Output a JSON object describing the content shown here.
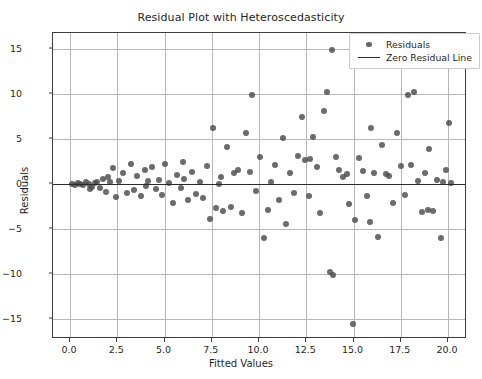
{
  "chart_data": {
    "type": "scatter",
    "title": "Residual Plot with Heteroscedasticity",
    "xlabel": "Fitted Values",
    "ylabel": "Residuals",
    "xlim": [
      -0.9,
      21.0
    ],
    "ylim": [
      -17.2,
      16.8
    ],
    "grid": true,
    "legend_position": "upper right",
    "xticks": [
      "0.0",
      "2.5",
      "5.0",
      "7.5",
      "10.0",
      "12.5",
      "15.0",
      "17.5",
      "20.0"
    ],
    "xtick_values": [
      0.0,
      2.5,
      5.0,
      7.5,
      10.0,
      12.5,
      15.0,
      17.5,
      20.0
    ],
    "yticks": [
      "15",
      "10",
      "5",
      "0",
      "−5",
      "−10",
      "−15"
    ],
    "ytick_values": [
      15,
      10,
      5,
      0,
      -5,
      -10,
      -15
    ],
    "series": [
      {
        "name": "Residuals",
        "marker": "circle",
        "color": "#4a4a4a",
        "points": [
          [
            0.1,
            0.05
          ],
          [
            0.25,
            -0.1
          ],
          [
            0.4,
            0.15
          ],
          [
            0.55,
            0.05
          ],
          [
            0.7,
            -0.05
          ],
          [
            0.85,
            0.2
          ],
          [
            1.0,
            0.0
          ],
          [
            1.15,
            -0.3
          ],
          [
            1.3,
            0.1
          ],
          [
            1.45,
            0.25
          ],
          [
            1.6,
            -0.4
          ],
          [
            1.75,
            0.6
          ],
          [
            1.9,
            -0.9
          ],
          [
            2.1,
            0.3
          ],
          [
            2.3,
            1.8
          ],
          [
            2.45,
            -1.4
          ],
          [
            2.6,
            0.4
          ],
          [
            2.8,
            1.3
          ],
          [
            3.0,
            -1.0
          ],
          [
            3.2,
            2.2
          ],
          [
            3.4,
            -0.6
          ],
          [
            3.55,
            0.9
          ],
          [
            3.75,
            -1.3
          ],
          [
            3.95,
            1.6
          ],
          [
            4.15,
            0.35
          ],
          [
            4.35,
            1.9
          ],
          [
            4.55,
            -0.5
          ],
          [
            4.7,
            0.45
          ],
          [
            4.85,
            -1.2
          ],
          [
            5.05,
            2.3
          ],
          [
            5.25,
            0.1
          ],
          [
            5.45,
            -2.1
          ],
          [
            5.65,
            1.05
          ],
          [
            5.85,
            -0.45
          ],
          [
            6.05,
            0.55
          ],
          [
            6.25,
            -1.7
          ],
          [
            6.45,
            1.4
          ],
          [
            6.65,
            -1.05
          ],
          [
            6.85,
            0.2
          ],
          [
            7.05,
            -1.55
          ],
          [
            7.25,
            2.05
          ],
          [
            7.4,
            -3.9
          ],
          [
            7.55,
            6.2
          ],
          [
            7.7,
            -2.6
          ],
          [
            7.9,
            0.05
          ],
          [
            8.1,
            -2.95
          ],
          [
            8.3,
            4.1
          ],
          [
            8.5,
            -2.55
          ],
          [
            8.7,
            1.25
          ],
          [
            8.9,
            1.55
          ],
          [
            9.1,
            -3.25
          ],
          [
            9.3,
            5.7
          ],
          [
            9.5,
            1.35
          ],
          [
            9.65,
            9.9
          ],
          [
            9.85,
            -0.75
          ],
          [
            10.05,
            3.05
          ],
          [
            10.25,
            -5.95
          ],
          [
            10.45,
            -2.9
          ],
          [
            10.65,
            0.25
          ],
          [
            10.85,
            2.15
          ],
          [
            11.05,
            -1.7
          ],
          [
            11.25,
            5.15
          ],
          [
            11.45,
            -4.45
          ],
          [
            11.65,
            1.2
          ],
          [
            11.85,
            -0.95
          ],
          [
            12.05,
            3.1
          ],
          [
            12.25,
            7.5
          ],
          [
            12.45,
            2.7
          ],
          [
            12.65,
            -1.35
          ],
          [
            12.85,
            5.2
          ],
          [
            13.05,
            1.95
          ],
          [
            13.25,
            -3.2
          ],
          [
            13.45,
            8.1
          ],
          [
            13.6,
            10.2
          ],
          [
            13.75,
            -9.7
          ],
          [
            13.85,
            14.95
          ],
          [
            13.9,
            -10.05
          ],
          [
            14.05,
            3.05
          ],
          [
            14.25,
            1.55
          ],
          [
            14.45,
            0.8
          ],
          [
            14.65,
            1.1
          ],
          [
            14.75,
            -2.15
          ],
          [
            14.95,
            -15.5
          ],
          [
            15.1,
            -3.95
          ],
          [
            15.3,
            2.9
          ],
          [
            15.5,
            1.45
          ],
          [
            15.7,
            -1.3
          ],
          [
            15.9,
            6.3
          ],
          [
            16.1,
            1.3
          ],
          [
            16.3,
            -5.9
          ],
          [
            16.5,
            4.35
          ],
          [
            16.7,
            1.15
          ],
          [
            16.9,
            0.9
          ],
          [
            17.1,
            -2.05
          ],
          [
            17.3,
            5.7
          ],
          [
            17.5,
            2.0
          ],
          [
            17.7,
            -1.25
          ],
          [
            17.9,
            9.95
          ],
          [
            18.05,
            2.15
          ],
          [
            18.2,
            10.3
          ],
          [
            18.4,
            0.35
          ],
          [
            18.6,
            -3.05
          ],
          [
            18.8,
            1.2
          ],
          [
            19.0,
            3.95
          ],
          [
            19.2,
            -2.95
          ],
          [
            19.4,
            0.45
          ],
          [
            19.6,
            -5.95
          ],
          [
            19.75,
            0.2
          ],
          [
            19.9,
            1.55
          ],
          [
            20.05,
            6.85
          ],
          [
            20.15,
            0.1
          ],
          [
            1.05,
            -0.55
          ],
          [
            2.0,
            0.75
          ],
          [
            4.0,
            -0.2
          ],
          [
            6.0,
            2.45
          ],
          [
            8.0,
            0.85
          ],
          [
            12.7,
            2.85
          ],
          [
            15.85,
            -4.2
          ],
          [
            18.95,
            -2.85
          ]
        ]
      },
      {
        "name": "Zero Residual Line",
        "type": "hline",
        "y": 0,
        "color": "#2b2b2b"
      }
    ],
    "legend_entries": [
      {
        "label": "Residuals",
        "symbol": "dot"
      },
      {
        "label": "Zero Residual Line",
        "symbol": "line"
      }
    ]
  }
}
